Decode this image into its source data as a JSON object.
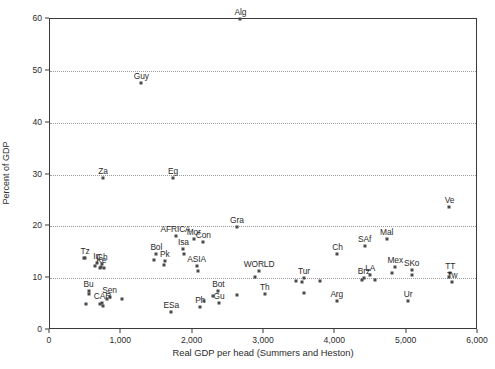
{
  "chart_data": {
    "type": "scatter",
    "title": "",
    "xlabel": "Real GDP per head (Summers and Heston)",
    "ylabel": "Percent of GDP",
    "xlim": [
      0,
      6000
    ],
    "ylim": [
      0,
      60
    ],
    "xticks": [
      "0",
      "1,000",
      "2,000",
      "3,000",
      "4,000",
      "5,000",
      "6,000"
    ],
    "xtick_values": [
      0,
      1000,
      2000,
      3000,
      4000,
      5000,
      6000
    ],
    "yticks": [
      "0",
      "10",
      "20",
      "30",
      "40",
      "50",
      "60"
    ],
    "ytick_values": [
      0,
      10,
      20,
      30,
      40,
      50,
      60
    ],
    "gridlines": {
      "y": [
        10,
        20,
        30,
        40,
        50
      ],
      "style": "dotted",
      "x": "none"
    },
    "legend": "none",
    "marker": "small filled square",
    "points": [
      {
        "label": "Alg",
        "x": 2670,
        "y": 60.0
      },
      {
        "label": "Guy",
        "x": 1280,
        "y": 47.6
      },
      {
        "label": "Ve",
        "x": 5600,
        "y": 23.8
      },
      {
        "label": "Za",
        "x": 745,
        "y": 29.4
      },
      {
        "label": "Eg",
        "x": 1725,
        "y": 29.4
      },
      {
        "label": "Gra",
        "x": 2620,
        "y": 19.9
      },
      {
        "label": "AFRICA",
        "x": 1760,
        "y": 18.2
      },
      {
        "label": "Mor",
        "x": 2015,
        "y": 17.6
      },
      {
        "label": "Con",
        "x": 2150,
        "y": 16.9
      },
      {
        "label": "Mal",
        "x": 4720,
        "y": 17.5
      },
      {
        "label": "SAf",
        "x": 4410,
        "y": 16.3
      },
      {
        "label": "Isa",
        "x": 1870,
        "y": 15.6
      },
      {
        "label": "Bol",
        "x": 1490,
        "y": 14.6
      },
      {
        "label": "Ch",
        "x": 4030,
        "y": 14.7
      },
      {
        "label": "Tz",
        "x": 490,
        "y": 13.9
      },
      {
        "label": "Pk",
        "x": 1610,
        "y": 13.3
      },
      {
        "label": "In",
        "x": 655,
        "y": 13.0
      },
      {
        "label": "Gh",
        "x": 730,
        "y": 12.7
      },
      {
        "label": "Ke",
        "x": 720,
        "y": 12.2
      },
      {
        "label": "ASIA",
        "x": 2055,
        "y": 12.3
      },
      {
        "label": "Mex",
        "x": 4840,
        "y": 12.1
      },
      {
        "label": "SKo",
        "x": 5070,
        "y": 11.5
      },
      {
        "label": "WORLD",
        "x": 2930,
        "y": 11.3
      },
      {
        "label": "TT",
        "x": 5610,
        "y": 11.0
      },
      {
        "label": "LA",
        "x": 4490,
        "y": 10.6
      },
      {
        "label": "Tur",
        "x": 3560,
        "y": 10.1
      },
      {
        "label": "Brz",
        "x": 4400,
        "y": 10.0
      },
      {
        "label": "Tw",
        "x": 5640,
        "y": 9.3
      },
      {
        "label": "Bu",
        "x": 540,
        "y": 7.6
      },
      {
        "label": "Bot",
        "x": 2360,
        "y": 7.5
      },
      {
        "label": "Th",
        "x": 3010,
        "y": 6.9
      },
      {
        "label": "Sen",
        "x": 835,
        "y": 6.3
      },
      {
        "label": "CAR",
        "x": 735,
        "y": 5.3
      },
      {
        "label": "Arg",
        "x": 4020,
        "y": 5.6
      },
      {
        "label": "Ur",
        "x": 5020,
        "y": 5.6
      },
      {
        "label": "Gu",
        "x": 2370,
        "y": 5.2
      },
      {
        "label": "Ph",
        "x": 2105,
        "y": 4.5
      },
      {
        "label": "ESa",
        "x": 1700,
        "y": 3.5
      }
    ],
    "extra_markers": [
      {
        "x": 470,
        "y": 13.8
      },
      {
        "x": 630,
        "y": 12.3
      },
      {
        "x": 700,
        "y": 12.0
      },
      {
        "x": 750,
        "y": 11.9
      },
      {
        "x": 545,
        "y": 6.9
      },
      {
        "x": 510,
        "y": 5.0
      },
      {
        "x": 705,
        "y": 5.0
      },
      {
        "x": 745,
        "y": 4.7
      },
      {
        "x": 800,
        "y": 6.0
      },
      {
        "x": 1010,
        "y": 6.0
      },
      {
        "x": 1460,
        "y": 13.5
      },
      {
        "x": 1600,
        "y": 12.5
      },
      {
        "x": 1880,
        "y": 14.6
      },
      {
        "x": 2070,
        "y": 11.3
      },
      {
        "x": 2160,
        "y": 5.6
      },
      {
        "x": 2290,
        "y": 6.5
      },
      {
        "x": 2620,
        "y": 6.7
      },
      {
        "x": 2880,
        "y": 10.2
      },
      {
        "x": 3450,
        "y": 9.4
      },
      {
        "x": 3530,
        "y": 9.3
      },
      {
        "x": 3560,
        "y": 7.1
      },
      {
        "x": 3780,
        "y": 9.4
      },
      {
        "x": 4370,
        "y": 9.7
      },
      {
        "x": 4560,
        "y": 9.7
      },
      {
        "x": 4790,
        "y": 11.0
      },
      {
        "x": 5070,
        "y": 10.6
      },
      {
        "x": 5600,
        "y": 10.3
      }
    ]
  }
}
